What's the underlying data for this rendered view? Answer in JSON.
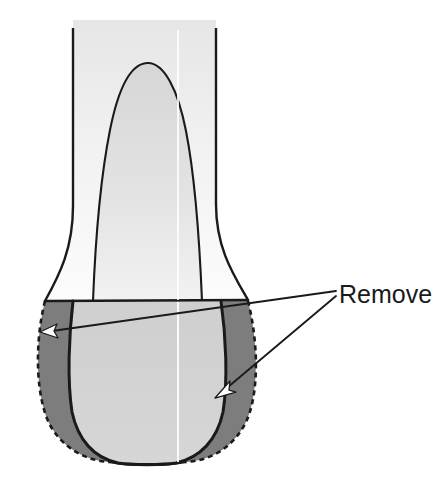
{
  "figure": {
    "background_color": "#ffffff",
    "colors": {
      "outline": "#1a1a1a",
      "removal_zone_fill": "#7d7d7d",
      "crown_inner_fill": "#d2d2d2",
      "stem_fill_top": "#ececec",
      "stem_fill_bottom": "#fafafa",
      "pulp_fill": "#d8d8d8",
      "arrow_stroke": "#1a1a1a",
      "arrowhead_fill": "#ffffff",
      "midline": "#ffffff",
      "dashed_outline": "#1a1a1a",
      "label_text": "#1a1a1a"
    },
    "annotations": [
      {
        "id": "remove-label",
        "text": "Remove",
        "x": 339,
        "y": 280,
        "font_size": 25,
        "leader_lines": [
          {
            "id": "leader-left",
            "from": [
              336,
              292
            ],
            "to": [
              46,
              332
            ],
            "arrow": "left"
          },
          {
            "id": "leader-right",
            "from": [
              336,
              294
            ],
            "to": [
              222,
              394
            ],
            "arrow": "down-left"
          }
        ]
      }
    ],
    "geometry": {
      "stem_left_line_x": 73,
      "stem_right_line_x": 216,
      "stem_top_y": 28,
      "crown_shoulder_y": 301,
      "crown_shoulder_left_x": 45,
      "crown_shoulder_right_x": 248,
      "crown_bottom_y": 463,
      "midline_x": 147,
      "pulp_apex_y": 63
    }
  }
}
